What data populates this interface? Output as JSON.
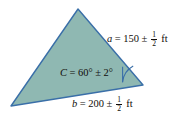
{
  "figure": {
    "colors": {
      "fill": "#8fb8b2",
      "stroke": "#3a6fa8",
      "text": "#100c0a",
      "background": "#ffffff"
    },
    "shape": {
      "type": "triangle",
      "vertices": [
        {
          "name": "apex",
          "x": 78,
          "y": 9
        },
        {
          "name": "bottom-left",
          "x": 11,
          "y": 106
        },
        {
          "name": "bottom-right",
          "x": 143,
          "y": 85
        }
      ]
    },
    "angle_arc": {
      "at_vertex": "bottom-right",
      "marks": "C"
    }
  },
  "labels": {
    "side_a": {
      "variable": "a",
      "equals": "=",
      "value": "150",
      "plusminus": "±",
      "tolerance_numerator": "1",
      "tolerance_denominator": "2",
      "unit": "ft",
      "full_text": "a = 150 ± 1/2 ft"
    },
    "angle_c": {
      "variable": "C",
      "equals": "=",
      "value": "60°",
      "plusminus": "±",
      "tolerance": "2°",
      "full_text": "C = 60° ± 2°"
    },
    "side_b": {
      "variable": "b",
      "equals": "=",
      "value": "200",
      "plusminus": "±",
      "tolerance_numerator": "1",
      "tolerance_denominator": "2",
      "unit": "ft",
      "full_text": "b = 200 ± 1/2 ft"
    }
  }
}
